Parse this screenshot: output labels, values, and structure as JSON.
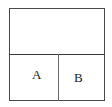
{
  "diagram": {
    "regions": [
      {
        "id": "top",
        "label": ""
      },
      {
        "id": "bottom-left",
        "label": "A"
      },
      {
        "id": "bottom-right",
        "label": "B"
      }
    ],
    "labels": {
      "a": "A",
      "b": "B"
    },
    "colors": {
      "line": "#4a4a4a",
      "text": "#222222",
      "background": "#ffffff"
    }
  }
}
